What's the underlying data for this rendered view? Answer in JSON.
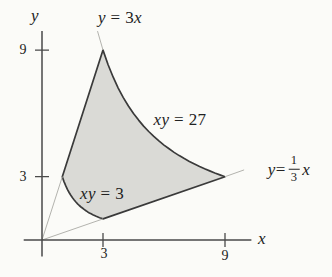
{
  "figure": {
    "background": "#fbfbf8",
    "colors": {
      "region_fill": "#dadad6",
      "curve_stroke": "#3a3a3a",
      "axis_stroke": "#4a4a4a",
      "faint_stroke": "#b3b3ae",
      "text": "#222222"
    },
    "axes": {
      "x_label": "x",
      "y_label": "y",
      "x_ticks": [
        {
          "value": 3,
          "label": "3"
        },
        {
          "value": 9,
          "label": "9"
        }
      ],
      "y_ticks": [
        {
          "value": 3,
          "label": "3"
        },
        {
          "value": 9,
          "label": "9"
        }
      ]
    },
    "labels": {
      "eq_line_steep": {
        "a": "y",
        "b": " = 3",
        "c": "x"
      },
      "eq_hyp_outer": {
        "a": "xy",
        "b": " = 27"
      },
      "eq_hyp_inner": {
        "a": "xy",
        "b": " = 3"
      },
      "eq_line_shallow": {
        "a": "y",
        "b": " = ",
        "num": "1",
        "den": "3",
        "c": "x"
      }
    },
    "geometry": {
      "origin_px": [
        42,
        240
      ],
      "unit_px": [
        20.33,
        21.1
      ],
      "tick_half_px": 7,
      "faint_segments": [
        [
          [
            0,
            0
          ],
          [
            1,
            3
          ]
        ],
        [
          [
            0,
            0
          ],
          [
            3,
            1
          ]
        ],
        [
          [
            9,
            3
          ],
          [
            9.94,
            3.32
          ]
        ],
        [
          [
            3,
            9
          ],
          [
            2.73,
            9.9
          ]
        ]
      ]
    }
  },
  "chart_data": {
    "type": "region-plot",
    "title": "",
    "xlabel": "x",
    "ylabel": "y",
    "xlim": [
      -0.9,
      10.3
    ],
    "ylim": [
      -0.78,
      9.9
    ],
    "x_ticks": [
      3,
      9
    ],
    "y_ticks": [
      3,
      9
    ],
    "region_vertices": [
      [
        1,
        3
      ],
      [
        3,
        9
      ],
      [
        9,
        3
      ],
      [
        3,
        1
      ]
    ],
    "curves": [
      {
        "equation": "y = 3x",
        "type": "line",
        "slope": 3,
        "role": "left-boundary",
        "segment": [
          [
            1,
            3
          ],
          [
            3,
            9
          ]
        ]
      },
      {
        "equation": "xy = 27",
        "type": "hyperbola",
        "k": 27,
        "role": "upper-right-boundary",
        "segment": [
          [
            3,
            9
          ],
          [
            9,
            3
          ]
        ]
      },
      {
        "equation": "y = (1/3)x",
        "type": "line",
        "slope": 0.3333,
        "role": "lower-right-boundary",
        "segment": [
          [
            9,
            3
          ],
          [
            3,
            1
          ]
        ]
      },
      {
        "equation": "xy = 3",
        "type": "hyperbola",
        "k": 3,
        "role": "lower-left-boundary",
        "segment": [
          [
            3,
            1
          ],
          [
            1,
            3
          ]
        ]
      }
    ]
  }
}
